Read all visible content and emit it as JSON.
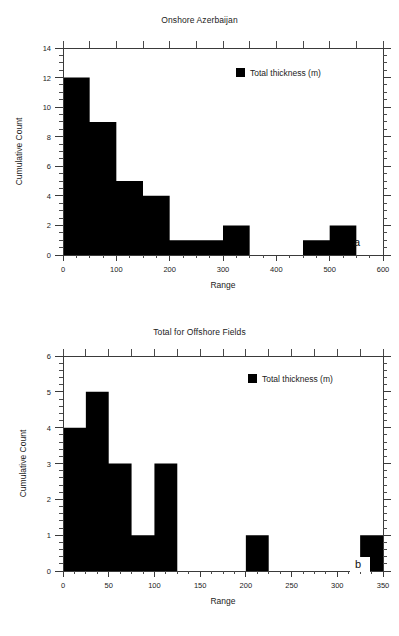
{
  "figure": {
    "background": "#ffffff",
    "ink_color": "#000000"
  },
  "panels": [
    {
      "id": "a",
      "letter": "a",
      "title": "Onshore Azerbaijan",
      "xlabel": "Range",
      "ylabel": "Cumulative Count",
      "legend_label": "Total thickness (m)"
    },
    {
      "id": "b",
      "letter": "b",
      "title": "Total for Offshore Fields",
      "xlabel": "Range",
      "ylabel": "Cumulative Count",
      "legend_label": "Total thickness (m)"
    }
  ],
  "chart_data": [
    {
      "type": "bar",
      "title": "Onshore Azerbaijan",
      "xlabel": "Range",
      "ylabel": "Cumulative Count",
      "legend": [
        "Total thickness (m)"
      ],
      "legend_position": "top-right-inside",
      "grid": false,
      "xlim": [
        0,
        600
      ],
      "ylim": [
        0,
        14
      ],
      "xticks": [
        0,
        100,
        200,
        300,
        400,
        500,
        600
      ],
      "xtick_labels": [
        "0",
        "100",
        "200",
        "300",
        "400",
        "500",
        "600"
      ],
      "xminor_interval": 25,
      "yticks": [
        0,
        2,
        4,
        6,
        8,
        10,
        12,
        14
      ],
      "ytick_labels": [
        "0",
        "2",
        "4",
        "6",
        "8",
        "10",
        "12",
        "14"
      ],
      "yminor_interval": 0.5,
      "bin_width": 50,
      "bin_edges": [
        0,
        50,
        100,
        150,
        200,
        250,
        300,
        350,
        400,
        450,
        500,
        550
      ],
      "values": [
        12,
        9,
        5,
        4,
        1,
        1,
        2,
        0,
        0,
        1,
        2
      ],
      "bars": [
        {
          "x0": 0,
          "x1": 50,
          "height": 12
        },
        {
          "x0": 50,
          "x1": 100,
          "height": 9
        },
        {
          "x0": 100,
          "x1": 150,
          "height": 5
        },
        {
          "x0": 150,
          "x1": 200,
          "height": 4
        },
        {
          "x0": 200,
          "x1": 250,
          "height": 1
        },
        {
          "x0": 250,
          "x1": 300,
          "height": 1
        },
        {
          "x0": 300,
          "x1": 350,
          "height": 2
        },
        {
          "x0": 350,
          "x1": 400,
          "height": 0
        },
        {
          "x0": 400,
          "x1": 450,
          "height": 0
        },
        {
          "x0": 450,
          "x1": 500,
          "height": 1
        },
        {
          "x0": 500,
          "x1": 550,
          "height": 2
        }
      ]
    },
    {
      "type": "bar",
      "title": "Total for Offshore Fields",
      "xlabel": "Range",
      "ylabel": "Cumulative Count",
      "legend": [
        "Total thickness (m)"
      ],
      "legend_position": "top-right-inside",
      "grid": false,
      "xlim": [
        0,
        350
      ],
      "ylim": [
        0,
        6
      ],
      "xticks": [
        0,
        50,
        100,
        150,
        200,
        250,
        300,
        350
      ],
      "xtick_labels": [
        "0",
        "50",
        "100",
        "150",
        "200",
        "250",
        "300",
        "350"
      ],
      "xminor_interval": 12.5,
      "yticks": [
        0,
        1,
        2,
        3,
        4,
        5,
        6
      ],
      "ytick_labels": [
        "0",
        "1",
        "2",
        "3",
        "4",
        "5",
        "6"
      ],
      "yminor_interval": 0.2,
      "bin_width": 25,
      "bin_edges": [
        0,
        25,
        50,
        75,
        100,
        125,
        150,
        175,
        200,
        225,
        250,
        275,
        300,
        325
      ],
      "values": [
        4,
        5,
        3,
        1,
        3,
        0,
        0,
        0,
        1,
        0,
        0,
        0,
        0,
        1
      ],
      "bars": [
        {
          "x0": 0,
          "x1": 25,
          "height": 4
        },
        {
          "x0": 25,
          "x1": 50,
          "height": 5
        },
        {
          "x0": 50,
          "x1": 75,
          "height": 3
        },
        {
          "x0": 75,
          "x1": 100,
          "height": 1
        },
        {
          "x0": 100,
          "x1": 125,
          "height": 3
        },
        {
          "x0": 125,
          "x1": 150,
          "height": 0
        },
        {
          "x0": 150,
          "x1": 175,
          "height": 0
        },
        {
          "x0": 175,
          "x1": 200,
          "height": 0
        },
        {
          "x0": 200,
          "x1": 225,
          "height": 1
        },
        {
          "x0": 225,
          "x1": 250,
          "height": 0
        },
        {
          "x0": 250,
          "x1": 275,
          "height": 0
        },
        {
          "x0": 275,
          "x1": 300,
          "height": 0
        },
        {
          "x0": 300,
          "x1": 325,
          "height": 0
        },
        {
          "x0": 325,
          "x1": 350,
          "height": 1
        }
      ]
    }
  ]
}
